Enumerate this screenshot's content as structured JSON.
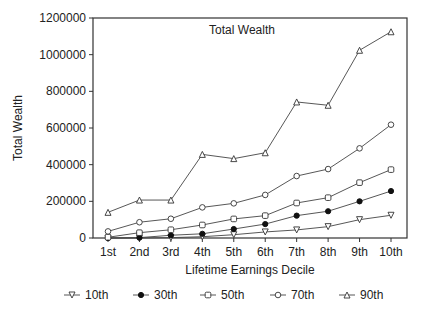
{
  "chart_data": {
    "type": "line",
    "title": "Total Wealth",
    "xlabel": "Lifetime Earnings Decile",
    "ylabel": "Total Wealth",
    "ylim": [
      0,
      1200000
    ],
    "yticks": [
      0,
      200000,
      400000,
      600000,
      800000,
      1000000,
      1200000
    ],
    "ytick_labels": [
      "0",
      "200000",
      "400000",
      "600000",
      "800000",
      "1000000",
      "1200000"
    ],
    "grid": false,
    "legend_position": "bottom",
    "categories": [
      "1st",
      "2nd",
      "3rd",
      "4th",
      "5th",
      "6th",
      "7th",
      "8th",
      "9th",
      "10th"
    ],
    "series": [
      {
        "name": "10th",
        "marker": "triangle-down-open",
        "values": [
          0,
          0,
          2000,
          7000,
          18000,
          33000,
          44000,
          62000,
          100000,
          124000
        ]
      },
      {
        "name": "30th",
        "marker": "circle-filled",
        "values": [
          0,
          2000,
          15000,
          23000,
          49000,
          76000,
          122000,
          146000,
          200000,
          256000
        ]
      },
      {
        "name": "50th",
        "marker": "square-open",
        "values": [
          4000,
          29000,
          45000,
          71000,
          104000,
          122000,
          191000,
          220000,
          302000,
          373000
        ]
      },
      {
        "name": "70th",
        "marker": "circle-open",
        "values": [
          36000,
          86000,
          105000,
          167000,
          189000,
          235000,
          338000,
          376000,
          489000,
          618000
        ]
      },
      {
        "name": "90th",
        "marker": "triangle-up-open",
        "values": [
          140000,
          207000,
          207000,
          456000,
          433000,
          465000,
          742000,
          724000,
          1024000,
          1125000
        ]
      }
    ]
  }
}
